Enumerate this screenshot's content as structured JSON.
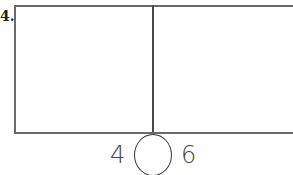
{
  "problem": {
    "label": "4.",
    "comparison": {
      "left_value": "4",
      "right_value": "6",
      "answer_blank": ""
    }
  }
}
